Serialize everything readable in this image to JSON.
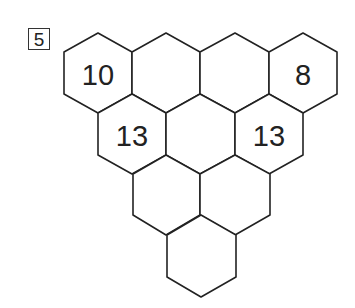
{
  "problem_label": "5",
  "puzzle": {
    "rows": [
      {
        "cells": [
          "10",
          "",
          "",
          "8"
        ]
      },
      {
        "cells": [
          "13",
          "",
          "13"
        ]
      },
      {
        "cells": [
          "",
          ""
        ]
      },
      {
        "cells": [
          ""
        ]
      }
    ]
  },
  "colors": {
    "stroke": "#222222",
    "background": "#ffffff"
  }
}
